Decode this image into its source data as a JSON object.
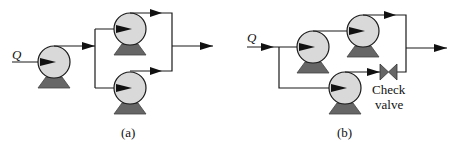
{
  "figure": {
    "panel_a": {
      "caption": "(a)",
      "input_label": "Q",
      "arrangement": "series-then-parallel",
      "pumps": [
        {
          "id": "a1",
          "role": "first stage pump"
        },
        {
          "id": "a2",
          "role": "parallel pump upper"
        },
        {
          "id": "a3",
          "role": "parallel pump lower"
        }
      ]
    },
    "panel_b": {
      "caption": "(b)",
      "input_label": "Q",
      "arrangement": "series branch with parallel bypass",
      "pumps": [
        {
          "id": "b1",
          "role": "series pump 1"
        },
        {
          "id": "b2",
          "role": "series pump 2"
        },
        {
          "id": "b3",
          "role": "parallel bypass pump"
        }
      ],
      "valve": {
        "label_line1": "Check",
        "label_line2": "valve"
      }
    },
    "colors": {
      "pump_body": "#d9d9d9",
      "pump_base": "#666666",
      "line": "#1a1a1a"
    }
  }
}
